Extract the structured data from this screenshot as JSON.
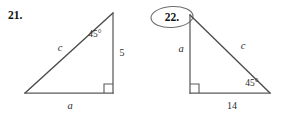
{
  "page": {
    "background_color": "#ffffff",
    "line_color": "#5a5a5a",
    "text_color": "#2b2b2b",
    "annotation_color": "#6e6e6e"
  },
  "problems": [
    {
      "number_label": "21.",
      "shape": "right-triangle",
      "angle_label": "45°",
      "hypotenuse_label": "c",
      "vertical_leg_label": "5",
      "horizontal_leg_label": "a",
      "right_angle_vertex": "bottom-right",
      "circled": false
    },
    {
      "number_label": "22.",
      "shape": "right-triangle",
      "angle_label": "45°",
      "hypotenuse_label": "c",
      "vertical_leg_label": "a",
      "horizontal_leg_label": "14",
      "right_angle_vertex": "bottom-left",
      "circled": true
    }
  ]
}
